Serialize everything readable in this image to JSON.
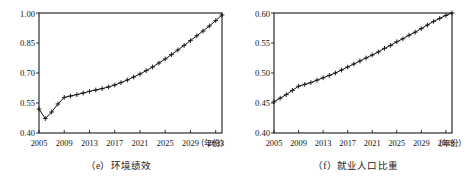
{
  "figure": {
    "panel_count": 2
  },
  "chart_data": [
    {
      "type": "line",
      "panel_label": "(e)",
      "title": "（e）环境绩效",
      "caption": "（e）环境绩效",
      "xlabel": "（年份）",
      "x_unit_label": "（年份）",
      "ylabel": "",
      "grid": false,
      "legend": null,
      "marker": "plus",
      "xlim": [
        2005,
        2034
      ],
      "ylim": [
        0.4,
        1.0
      ],
      "yticks": [
        "0.40",
        "0.55",
        "0.70",
        "0.85",
        "1.00"
      ],
      "ytick_values": [
        0.4,
        0.55,
        0.7,
        0.85,
        1.0
      ],
      "xticks": [
        "2005",
        "2009",
        "2013",
        "2017",
        "2021",
        "2025",
        "2029",
        "2033"
      ],
      "xtick_values": [
        2005,
        2009,
        2013,
        2017,
        2021,
        2025,
        2029,
        2033
      ],
      "x": [
        2005,
        2006,
        2007,
        2008,
        2009,
        2010,
        2011,
        2012,
        2013,
        2014,
        2015,
        2016,
        2017,
        2018,
        2019,
        2020,
        2021,
        2022,
        2023,
        2024,
        2025,
        2026,
        2027,
        2028,
        2029,
        2030,
        2031,
        2032,
        2033,
        2034
      ],
      "values": [
        0.52,
        0.472,
        0.505,
        0.545,
        0.578,
        0.585,
        0.592,
        0.6,
        0.608,
        0.615,
        0.622,
        0.63,
        0.64,
        0.652,
        0.665,
        0.68,
        0.695,
        0.712,
        0.73,
        0.75,
        0.77,
        0.792,
        0.815,
        0.838,
        0.862,
        0.886,
        0.91,
        0.935,
        0.962,
        0.99
      ]
    },
    {
      "type": "line",
      "panel_label": "(f)",
      "title": "（f）就业人口比重",
      "caption": "（f）就业人口比重",
      "xlabel": "（年份）",
      "x_unit_label": "（年份）",
      "ylabel": "",
      "grid": false,
      "legend": null,
      "marker": "plus",
      "xlim": [
        2005,
        2034
      ],
      "ylim": [
        0.4,
        0.6
      ],
      "yticks": [
        "0.40",
        "0.45",
        "0.50",
        "0.55",
        "0.60"
      ],
      "ytick_values": [
        0.4,
        0.45,
        0.5,
        0.55,
        0.6
      ],
      "xticks": [
        "2005",
        "2009",
        "2013",
        "2017",
        "2021",
        "2025",
        "2029",
        "2033"
      ],
      "xtick_values": [
        2005,
        2009,
        2013,
        2017,
        2021,
        2025,
        2029,
        2033
      ],
      "x": [
        2005,
        2006,
        2007,
        2008,
        2009,
        2010,
        2011,
        2012,
        2013,
        2014,
        2015,
        2016,
        2017,
        2018,
        2019,
        2020,
        2021,
        2022,
        2023,
        2024,
        2025,
        2026,
        2027,
        2028,
        2029,
        2030,
        2031,
        2032,
        2033,
        2034
      ],
      "values": [
        0.452,
        0.458,
        0.464,
        0.471,
        0.478,
        0.481,
        0.484,
        0.488,
        0.492,
        0.496,
        0.5,
        0.505,
        0.51,
        0.515,
        0.52,
        0.525,
        0.53,
        0.535,
        0.541,
        0.546,
        0.552,
        0.557,
        0.563,
        0.568,
        0.574,
        0.58,
        0.586,
        0.591,
        0.596,
        0.6
      ]
    }
  ]
}
